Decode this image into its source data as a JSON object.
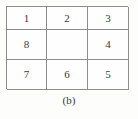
{
  "figure": {
    "caption": "(b)",
    "background_color": "#fdfdfc",
    "line_color": "#8d8d8d",
    "text_color": "#3a3a3a"
  },
  "grid": {
    "rows": 3,
    "columns": 3,
    "cells": [
      {
        "label": "1",
        "empty": false
      },
      {
        "label": "2",
        "empty": false
      },
      {
        "label": "3",
        "empty": false
      },
      {
        "label": "8",
        "empty": false
      },
      {
        "label": "",
        "empty": true
      },
      {
        "label": "4",
        "empty": false
      },
      {
        "label": "7",
        "empty": false
      },
      {
        "label": "6",
        "empty": false
      },
      {
        "label": "5",
        "empty": false
      }
    ]
  }
}
